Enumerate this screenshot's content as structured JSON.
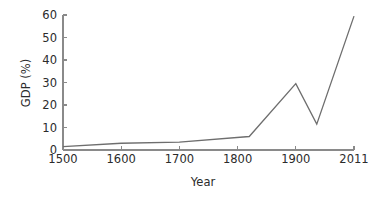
{
  "chart_data": {
    "type": "line",
    "title": "",
    "subtitle": "",
    "xlabel": "Year",
    "ylabel": "GDP (%)",
    "xlim": [
      1500,
      2011
    ],
    "ylim": [
      0,
      60
    ],
    "grid": false,
    "legend": null,
    "legend_position": "none",
    "annotations": [],
    "line_color": "#6e6e6e",
    "axis_color": "#8a8a8a",
    "text_color": "#2b2b2b",
    "background_color": "#ffffff",
    "xticks": [
      {
        "value": 1500,
        "label": "1500"
      },
      {
        "value": 1600,
        "label": "1600"
      },
      {
        "value": 1700,
        "label": "1700"
      },
      {
        "value": 1800,
        "label": "1800"
      },
      {
        "value": 1900,
        "label": "1900"
      },
      {
        "value": 2011,
        "label": "2011"
      }
    ],
    "yticks": [
      {
        "value": 0,
        "label": "0"
      },
      {
        "value": 10,
        "label": "10"
      },
      {
        "value": 20,
        "label": "20"
      },
      {
        "value": 30,
        "label": "30"
      },
      {
        "value": 40,
        "label": "40"
      },
      {
        "value": 50,
        "label": "50"
      },
      {
        "value": 60,
        "label": "60"
      }
    ],
    "series": [
      {
        "name": "GDP (%)",
        "x": [
          1500,
          1600,
          1700,
          1820,
          1900,
          1940,
          2011
        ],
        "values": [
          1.5,
          3,
          3.5,
          6,
          29.5,
          11.5,
          59.5
        ]
      }
    ]
  }
}
